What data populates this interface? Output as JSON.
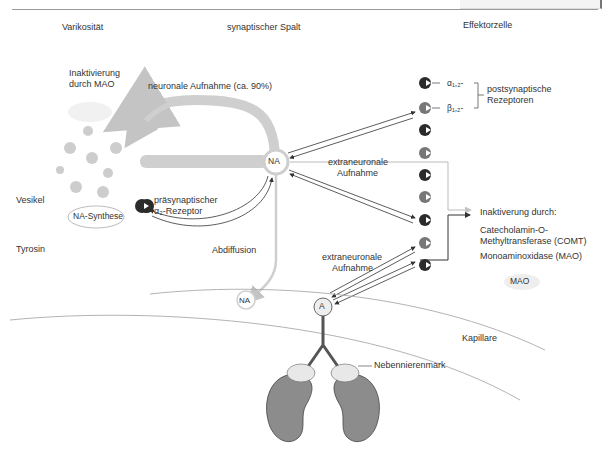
{
  "header": {
    "section_title_cropped": ""
  },
  "columns": {
    "left": "Varikosität",
    "middle": "synaptischer Spalt",
    "right": "Effektorzelle"
  },
  "labels": {
    "inactivation_mao_1": "Inaktivierung",
    "inactivation_mao_2": "durch MAO",
    "neuronal_uptake": "neuronale Aufnahme (ca. 90%)",
    "vesicle": "Vesikel",
    "na_synthesis": "NA-Synthese",
    "tyrosine": "Tyrosin",
    "presynaptic_1": "präsynaptischer",
    "presynaptic_2": "α₂-Rezeptor",
    "na_center": "NA",
    "extraneuronal_uptake_1a": "extraneuronale",
    "extraneuronal_uptake_1b": "Aufnahme",
    "abdiffusion": "Abdiffusion",
    "na_diffused": "NA",
    "extraneuronal_uptake_2a": "extraneuronale",
    "extraneuronal_uptake_2b": "Aufnahme",
    "adrenaline": "A",
    "alpha_receptor": "α₁,₂-",
    "beta_receptor": "β₁,₂-",
    "postsynaptic_1": "postsynaptische",
    "postsynaptic_2": "Rezeptoren",
    "inactivation_by": "Inaktiverung durch:",
    "comt_1": "Catecholamin-O-",
    "comt_2": "Methyltransferase (COMT)",
    "mao_full": "Monoaminoxidase (MAO)",
    "mao_small": "MAO",
    "capillary": "Kapillare",
    "adrenal_medulla": "Nebennierenmark"
  },
  "colors": {
    "pathway_gray": "#cfcfcf",
    "receptor_dark": "#2b2b2b",
    "receptor_mid": "#777777",
    "kidney": "#8c8c8c",
    "arrow_dark": "#333333",
    "arrow_light": "#bbbbbb"
  }
}
